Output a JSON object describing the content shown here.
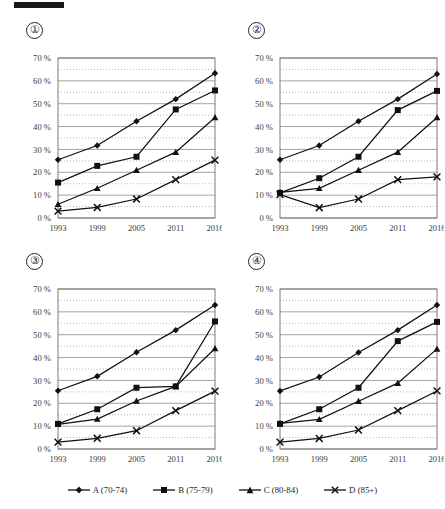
{
  "page": {
    "redaction_mark": "black-bar"
  },
  "legend": {
    "entries": [
      {
        "label": "A (70-74)",
        "marker": "diamond",
        "series_key": "A"
      },
      {
        "label": "B (75-79)",
        "marker": "square",
        "series_key": "B"
      },
      {
        "label": "C (80-84)",
        "marker": "triangle",
        "series_key": "C"
      },
      {
        "label": "D (85+)",
        "marker": "cross",
        "series_key": "D"
      }
    ]
  },
  "panels": [
    {
      "number": "①"
    },
    {
      "number": "②"
    },
    {
      "number": "③"
    },
    {
      "number": "④"
    }
  ],
  "chart_data": [
    {
      "type": "line",
      "title": "①",
      "xlabel": "",
      "ylabel": "",
      "categories": [
        "1993",
        "1999",
        "2005",
        "2011",
        "2016"
      ],
      "ylim": [
        0,
        70
      ],
      "yticks": [
        0,
        10,
        20,
        30,
        40,
        50,
        60,
        70
      ],
      "ytick_labels": [
        "0 %",
        "10 %",
        "20 %",
        "30 %",
        "40 %",
        "50 %",
        "60 %",
        "70 %"
      ],
      "minor_yticks": [
        5,
        15,
        25,
        35,
        45,
        55,
        65
      ],
      "grid": "major-solid-minor-dotted",
      "legend_position": "bottom-shared",
      "series": [
        {
          "name": "A (70-74)",
          "marker": "diamond",
          "values": [
            25.5,
            31.7,
            42.3,
            52.0,
            63.3
          ]
        },
        {
          "name": "B (75-79)",
          "marker": "square",
          "values": [
            15.5,
            22.8,
            26.8,
            47.5,
            55.8
          ]
        },
        {
          "name": "C (80-84)",
          "marker": "triangle",
          "values": [
            6.0,
            13.0,
            20.9,
            28.8,
            44.0
          ]
        },
        {
          "name": "D (85+)",
          "marker": "cross",
          "values": [
            3.0,
            4.6,
            8.3,
            16.8,
            25.3
          ]
        }
      ]
    },
    {
      "type": "line",
      "title": "②",
      "xlabel": "",
      "ylabel": "",
      "categories": [
        "1993",
        "1999",
        "2005",
        "2011",
        "2016"
      ],
      "ylim": [
        0,
        70
      ],
      "yticks": [
        0,
        10,
        20,
        30,
        40,
        50,
        60,
        70
      ],
      "ytick_labels": [
        "0 %",
        "10 %",
        "20 %",
        "30 %",
        "40 %",
        "50 %",
        "60 %",
        "70 %"
      ],
      "minor_yticks": [
        5,
        15,
        25,
        35,
        45,
        55,
        65
      ],
      "grid": "major-solid-minor-dotted",
      "legend_position": "bottom-shared",
      "series": [
        {
          "name": "A (70-74)",
          "marker": "diamond",
          "values": [
            25.5,
            31.7,
            42.3,
            52.0,
            63.0
          ]
        },
        {
          "name": "B (75-79)",
          "marker": "square",
          "values": [
            11.0,
            17.4,
            26.8,
            47.2,
            55.6
          ]
        },
        {
          "name": "C (80-84)",
          "marker": "triangle",
          "values": [
            11.2,
            13.0,
            20.9,
            28.8,
            44.0
          ]
        },
        {
          "name": "D (85+)",
          "marker": "cross",
          "values": [
            10.2,
            4.5,
            8.3,
            16.8,
            18.0
          ]
        }
      ]
    },
    {
      "type": "line",
      "title": "③",
      "xlabel": "",
      "ylabel": "",
      "categories": [
        "1993",
        "1999",
        "2005",
        "2011",
        "2016"
      ],
      "ylim": [
        0,
        70
      ],
      "yticks": [
        0,
        10,
        20,
        30,
        40,
        50,
        60,
        70
      ],
      "ytick_labels": [
        "0 %",
        "10 %",
        "20 %",
        "30 %",
        "40 %",
        "50 %",
        "60 %",
        "70 %"
      ],
      "minor_yticks": [
        5,
        15,
        25,
        35,
        45,
        55,
        65
      ],
      "grid": "major-solid-minor-dotted",
      "legend_position": "bottom-shared",
      "series": [
        {
          "name": "A (70-74)",
          "marker": "diamond",
          "values": [
            25.5,
            31.8,
            42.3,
            52.0,
            63.0
          ]
        },
        {
          "name": "B (75-79)",
          "marker": "square",
          "values": [
            11.0,
            17.4,
            26.8,
            27.4,
            55.8
          ]
        },
        {
          "name": "C (80-84)",
          "marker": "triangle",
          "values": [
            10.8,
            13.1,
            21.0,
            27.4,
            44.0
          ]
        },
        {
          "name": "D (85+)",
          "marker": "cross",
          "values": [
            3.0,
            4.7,
            8.0,
            16.8,
            25.3
          ]
        }
      ]
    },
    {
      "type": "line",
      "title": "④",
      "xlabel": "",
      "ylabel": "",
      "categories": [
        "1993",
        "1999",
        "2005",
        "2011",
        "2016"
      ],
      "ylim": [
        0,
        70
      ],
      "yticks": [
        0,
        10,
        20,
        30,
        40,
        50,
        60,
        70
      ],
      "ytick_labels": [
        "0 %",
        "10 %",
        "20 %",
        "30 %",
        "40 %",
        "50 %",
        "60 %",
        "70 %"
      ],
      "minor_yticks": [
        5,
        15,
        25,
        35,
        45,
        55,
        65
      ],
      "grid": "major-solid-minor-dotted",
      "legend_position": "bottom-shared",
      "series": [
        {
          "name": "A (70-74)",
          "marker": "diamond",
          "values": [
            25.4,
            31.5,
            42.2,
            52.0,
            63.0
          ]
        },
        {
          "name": "B (75-79)",
          "marker": "square",
          "values": [
            11.0,
            17.4,
            26.8,
            47.2,
            55.6
          ]
        },
        {
          "name": "C (80-84)",
          "marker": "triangle",
          "values": [
            11.2,
            13.0,
            20.9,
            28.8,
            43.8
          ]
        },
        {
          "name": "D (85+)",
          "marker": "cross",
          "values": [
            3.0,
            4.6,
            8.3,
            16.8,
            25.4
          ]
        }
      ]
    }
  ]
}
